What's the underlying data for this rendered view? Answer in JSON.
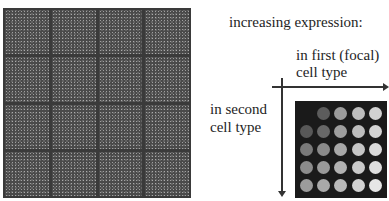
{
  "microarray": {
    "rows": 4,
    "cols": 4,
    "description": "microarray scan image"
  },
  "legend": {
    "title": "increasing expression:",
    "x_axis_label_line1": "in first (focal)",
    "x_axis_label_line2": "cell type",
    "y_axis_label_line1": "in second",
    "y_axis_label_line2": "cell type"
  },
  "dot_grid": {
    "rows": 5,
    "cols": 5,
    "colors": [
      [
        "",
        "#5c5c5c",
        "#9c9c9c",
        "#bdbdbd",
        "#d2d2d2"
      ],
      [
        "#585858",
        "#686868",
        "#9e9e9e",
        "#bebebe",
        "#d4d4d4"
      ],
      [
        "#7a7a7a",
        "#8a8a8a",
        "#a8a8a8",
        "#c6c6c6",
        "#dadada"
      ],
      [
        "#8c8c8c",
        "#9a9a9a",
        "#b2b2b2",
        "#cacaca",
        "#dedede"
      ],
      [
        "#9c9c9c",
        "#a9a9a9",
        "#b9b9b9",
        "#d2d2d2",
        "#e6e6e6"
      ]
    ]
  }
}
